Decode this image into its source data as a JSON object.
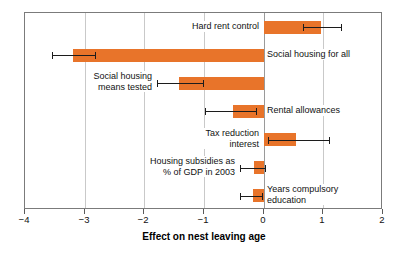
{
  "chart_data": {
    "type": "bar",
    "orientation": "horizontal",
    "title": "",
    "xlabel": "Effect on nest leaving age",
    "ylabel": "",
    "xlim": [
      -4,
      2
    ],
    "xticks": [
      -4,
      -3,
      -2,
      -1,
      0,
      1,
      2
    ],
    "xtick_labels": [
      "−4",
      "−3",
      "−2",
      "−1",
      "0",
      "1",
      "2"
    ],
    "grid": true,
    "grid_axis": "x",
    "legend": "none",
    "bar_color": "#e8742a",
    "error_bar_color": "#1c1c1c",
    "frame_color": "#7b7b7b",
    "gridline_color": "#c9c9c9",
    "categories": [
      "Hard rent control",
      "Social housing for all",
      "Social housing\nmeans tested",
      "Rental allowances",
      "Tax reduction\ninterest",
      "Housing subsidies as\n% of GDP in 2003",
      "Years compulsory\neducation"
    ],
    "values": [
      0.96,
      -3.19,
      -1.42,
      -0.52,
      0.55,
      -0.17,
      -0.18
    ],
    "error_low": [
      0.66,
      -3.55,
      -1.78,
      -0.99,
      0.07,
      -0.39,
      -0.39
    ],
    "error_high": [
      1.29,
      -2.83,
      -1.02,
      -0.13,
      1.09,
      0.02,
      -0.02
    ],
    "label_side": [
      "left",
      "right",
      "left",
      "right",
      "left",
      "left",
      "right"
    ],
    "series": [
      {
        "name": "Effect on nest leaving age",
        "values": [
          0.96,
          -3.19,
          -1.42,
          -0.52,
          0.55,
          -0.17,
          -0.18
        ]
      }
    ]
  },
  "axis": {
    "x_title": "Effect on nest leaving age"
  }
}
